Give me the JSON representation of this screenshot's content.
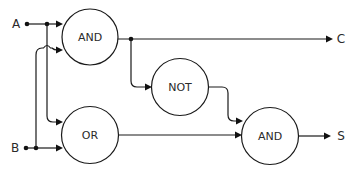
{
  "diagram": {
    "inputs": [
      {
        "id": "A",
        "label": "A"
      },
      {
        "id": "B",
        "label": "B"
      }
    ],
    "outputs": [
      {
        "id": "C",
        "label": "C"
      },
      {
        "id": "S",
        "label": "S"
      }
    ],
    "gates": [
      {
        "id": "and1",
        "label": "AND"
      },
      {
        "id": "or1",
        "label": "OR"
      },
      {
        "id": "not1",
        "label": "NOT"
      },
      {
        "id": "and2",
        "label": "AND"
      }
    ],
    "connections": [
      {
        "from": "A",
        "to": "and1"
      },
      {
        "from": "A",
        "to": "or1"
      },
      {
        "from": "B",
        "to": "and1"
      },
      {
        "from": "B",
        "to": "or1"
      },
      {
        "from": "and1",
        "to": "C"
      },
      {
        "from": "and1",
        "to": "not1"
      },
      {
        "from": "not1",
        "to": "and2"
      },
      {
        "from": "or1",
        "to": "and2"
      },
      {
        "from": "and2",
        "to": "S"
      }
    ],
    "colors": {
      "line": "#1a1a1a",
      "text": "#2a2a2a",
      "background": "#ffffff"
    }
  }
}
